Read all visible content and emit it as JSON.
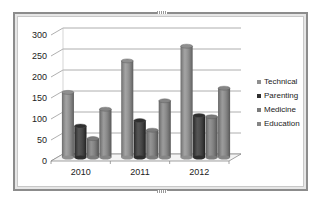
{
  "chart_data": {
    "type": "bar",
    "subtype": "3d-clustered-column",
    "title": "",
    "xlabel": "",
    "ylabel": "",
    "categories": [
      "2010",
      "2011",
      "2012"
    ],
    "series": [
      {
        "name": "Technical",
        "color": "#8f8f8f",
        "values": [
          155,
          230,
          265
        ]
      },
      {
        "name": "Parenting",
        "color": "#2f2f2f",
        "values": [
          75,
          88,
          100
        ]
      },
      {
        "name": "Medicine",
        "color": "#7b7b7b",
        "values": [
          45,
          65,
          97
        ]
      },
      {
        "name": "Education",
        "color": "#858585",
        "values": [
          115,
          135,
          165
        ]
      }
    ],
    "ylim": [
      0,
      300
    ],
    "yticks": [
      "0",
      "50",
      "100",
      "150",
      "200",
      "250",
      "300"
    ],
    "grid": true,
    "legend_position": "right"
  }
}
